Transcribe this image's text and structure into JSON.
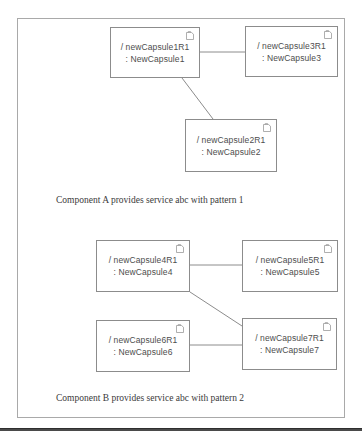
{
  "diagram": {
    "type": "uml-capsule-structure-diagram",
    "frame": {
      "border_color": "#a9a9a9"
    },
    "icon_name": "capsule-component-icon",
    "capsules": [
      {
        "id": "capsule1",
        "role_line": "/ newCapsule1R1",
        "type_line": ": NewCapsule1",
        "group": "A"
      },
      {
        "id": "capsule3",
        "role_line": "/ newCapsule3R1",
        "type_line": ": NewCapsule3",
        "group": "A"
      },
      {
        "id": "capsule2",
        "role_line": "/ newCapsule2R1",
        "type_line": ": NewCapsule2",
        "group": "A"
      },
      {
        "id": "capsule4",
        "role_line": "/ newCapsule4R1",
        "type_line": ": NewCapsule4",
        "group": "B"
      },
      {
        "id": "capsule5",
        "role_line": "/ newCapsule5R1",
        "type_line": ": NewCapsule5",
        "group": "B"
      },
      {
        "id": "capsule6",
        "role_line": "/ newCapsule6R1",
        "type_line": ": NewCapsule6",
        "group": "B"
      },
      {
        "id": "capsule7",
        "role_line": "/ newCapsule7R1",
        "type_line": ": NewCapsule7",
        "group": "B"
      }
    ],
    "connectors": [
      {
        "id": "c1-c3",
        "from": "capsule1",
        "to": "capsule3"
      },
      {
        "id": "c1-c2",
        "from": "capsule1",
        "to": "capsule2"
      },
      {
        "id": "c4-c5",
        "from": "capsule4",
        "to": "capsule5"
      },
      {
        "id": "c4-c7",
        "from": "capsule4",
        "to": "capsule7"
      },
      {
        "id": "c6-c7",
        "from": "capsule6",
        "to": "capsule7"
      }
    ],
    "captions": {
      "component_a": "Component A provides service abc with pattern 1",
      "component_b": "Component B provides service abc with pattern 2"
    }
  }
}
